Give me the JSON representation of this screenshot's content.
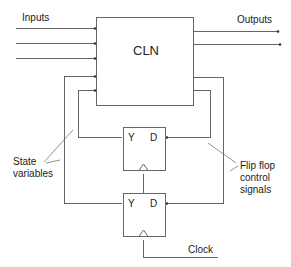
{
  "diagram": {
    "type": "sequential-circuit-block-diagram",
    "colors": {
      "line": "#555555",
      "box": "#777777",
      "text": "#222222",
      "background": "#ffffff"
    },
    "labels": {
      "inputs": "Inputs",
      "outputs": "Outputs",
      "cln": "CLN",
      "state_variables": [
        "State",
        "variables"
      ],
      "flip_flop_control": [
        "Flip flop",
        "control",
        "signals"
      ],
      "clock": "Clock"
    },
    "flip_flops": [
      {
        "id": "ff-upper",
        "output_label": "Y",
        "input_label": "D"
      },
      {
        "id": "ff-lower",
        "output_label": "Y",
        "input_label": "D"
      }
    ],
    "nodes": [
      {
        "id": "cln",
        "label": "CLN",
        "kind": "combinational-logic-network"
      },
      {
        "id": "ff-upper",
        "label": "Y D",
        "kind": "flip-flop"
      },
      {
        "id": "ff-lower",
        "label": "Y D",
        "kind": "flip-flop"
      }
    ],
    "edges": [
      {
        "from": "inputs",
        "to": "cln",
        "count": 3
      },
      {
        "from": "cln",
        "to": "outputs",
        "count": 2
      },
      {
        "from": "ff-upper.Y",
        "to": "cln",
        "label": "state variable"
      },
      {
        "from": "ff-lower.Y",
        "to": "cln",
        "label": "state variable"
      },
      {
        "from": "cln",
        "to": "ff-upper.D",
        "label": "flip flop control signal"
      },
      {
        "from": "cln",
        "to": "ff-lower.D",
        "label": "flip flop control signal"
      },
      {
        "from": "clock",
        "to": "ff-lower.clk"
      },
      {
        "from": "ff-lower.clk",
        "to": "ff-upper.clk"
      }
    ]
  }
}
